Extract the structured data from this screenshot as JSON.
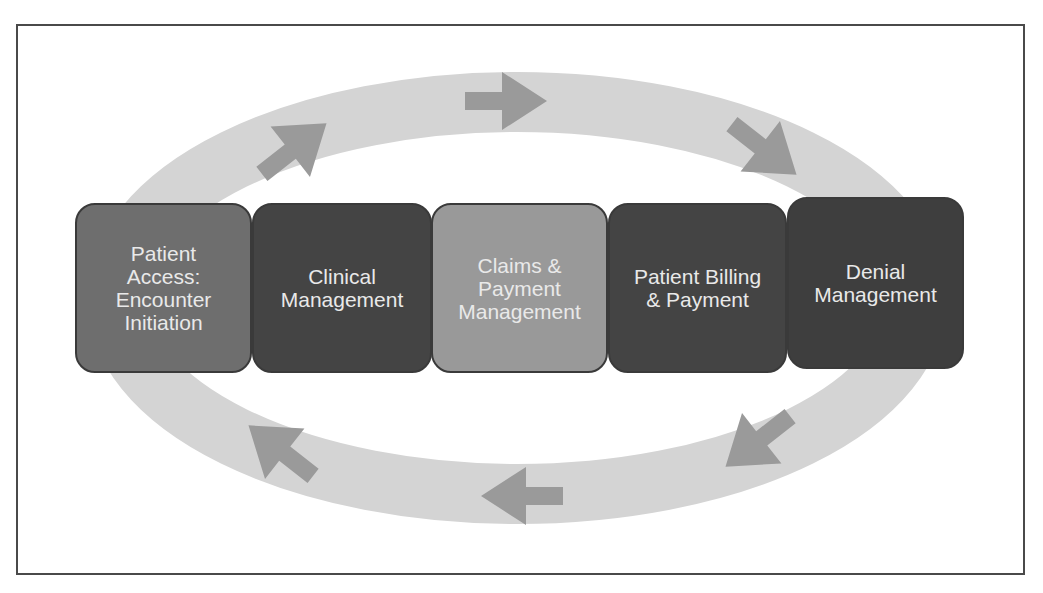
{
  "diagram": {
    "colors": {
      "frame_border": "#4a4a4a",
      "ring": "#d4d4d4",
      "arrow": "#9a9a9a",
      "text": "#e9e9e9"
    },
    "stages": [
      {
        "id": "patient-access",
        "label": "Patient\nAccess:\nEncounter\nInitiation",
        "fill": "#6e6e6e"
      },
      {
        "id": "clinical-management",
        "label": "Clinical\nManagement",
        "fill": "#444444"
      },
      {
        "id": "claims-payment-management",
        "label": "Claims &\nPayment\nManagement",
        "fill": "#999999"
      },
      {
        "id": "patient-billing-payment",
        "label": "Patient Billing\n& Payment",
        "fill": "#444444"
      },
      {
        "id": "denial-management",
        "label": "Denial\nManagement",
        "fill": "#3e3e3e"
      }
    ],
    "cycle": {
      "direction": "clockwise",
      "arrows": [
        "up-right",
        "right",
        "down-right",
        "down-left",
        "left",
        "up-left"
      ]
    }
  }
}
